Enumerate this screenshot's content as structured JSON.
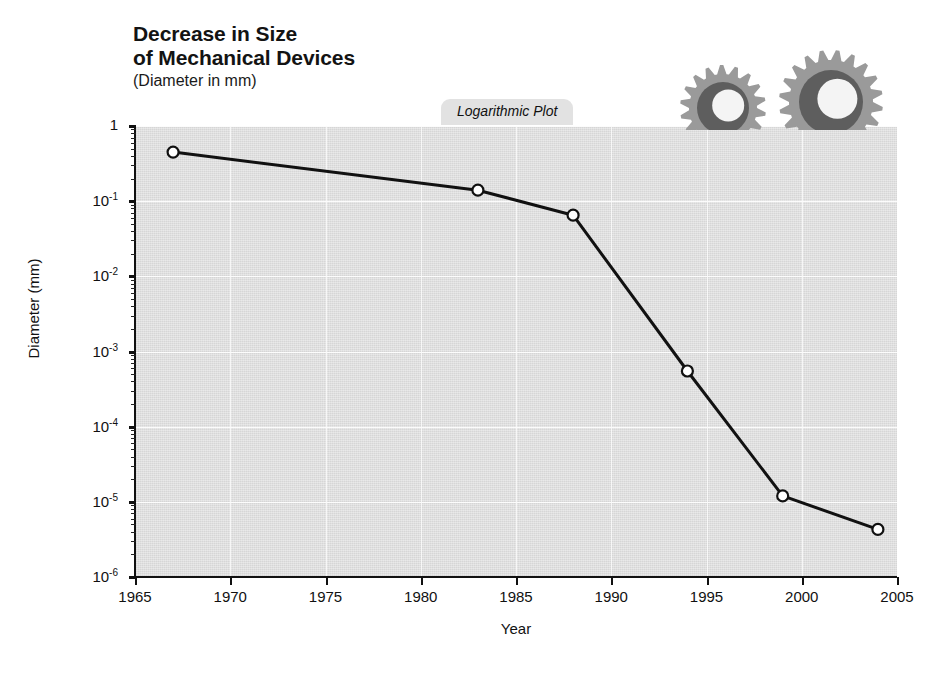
{
  "title": "Decrease in Size\nof Mechanical Devices",
  "subtitle": "(Diameter in mm)",
  "plot_tab_label": "Logarithmic Plot",
  "icons": {
    "gear_large": "gear-icon",
    "gear_small": "gear-icon"
  },
  "colors": {
    "plot_background": "#d6d6d6",
    "gridline": "#fdfdfd",
    "series_line": "#111111",
    "marker_fill": "#ffffff",
    "marker_stroke": "#111111",
    "tab_background": "#e2e2e2",
    "gear_light": "#9a9a9a",
    "gear_dark": "#5e5e5e",
    "text": "#111111"
  },
  "chart_data": {
    "type": "line",
    "title": "Decrease in Size of Mechanical Devices",
    "subtitle": "(Diameter in mm)",
    "annotation": "Logarithmic Plot",
    "xlabel": "Year",
    "ylabel": "Diameter (mm)",
    "yscale": "log",
    "xlim": [
      1965,
      2005
    ],
    "ylim": [
      1e-06,
      1
    ],
    "grid": true,
    "legend": null,
    "xticks": [
      1965,
      1970,
      1975,
      1980,
      1985,
      1990,
      1995,
      2000,
      2005
    ],
    "xticklabels": [
      "1965",
      "1970",
      "1975",
      "1980",
      "1985",
      "1990",
      "1995",
      "2000",
      "2005"
    ],
    "yticks": [
      1,
      0.1,
      0.01,
      0.001,
      0.0001,
      1e-05,
      1e-06
    ],
    "yticklabels": [
      "1",
      "10⁻¹",
      "10⁻²",
      "10⁻³",
      "10⁻⁴",
      "10⁻⁵",
      "10⁻⁶"
    ],
    "x": [
      1967,
      1983,
      1988,
      1994,
      1999,
      2004
    ],
    "values": [
      0.45,
      0.14,
      0.065,
      0.00055,
      1.2e-05,
      4.3e-06
    ],
    "series": [
      {
        "name": "Diameter (mm)",
        "marker": "circle-open",
        "points": [
          {
            "x": 1967,
            "y": 0.45
          },
          {
            "x": 1983,
            "y": 0.14
          },
          {
            "x": 1988,
            "y": 0.065
          },
          {
            "x": 1994,
            "y": 0.00055
          },
          {
            "x": 1999,
            "y": 1.2e-05
          },
          {
            "x": 2004,
            "y": 4.3e-06
          }
        ]
      }
    ]
  },
  "axes": {
    "y_title": "Diameter (mm)",
    "x_title": "Year"
  }
}
